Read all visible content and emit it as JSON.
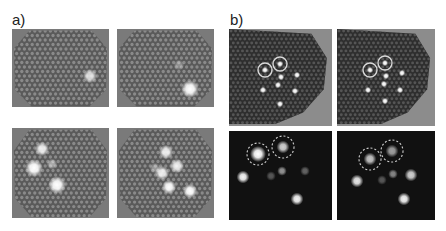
{
  "figure": {
    "labels": {
      "a": "a)",
      "b": "b)"
    },
    "group_a": {
      "description": "Brightfield images of hexagonal fiber bundle with bright spots",
      "panels": [
        {
          "id": "a-top-left",
          "spots": [
            {
              "x": 78,
              "y": 47,
              "r": 4,
              "bright": 0.8
            }
          ]
        },
        {
          "id": "a-top-right",
          "spots": [
            {
              "x": 62,
              "y": 36,
              "r": 3,
              "bright": 0.35
            },
            {
              "x": 73,
              "y": 60,
              "r": 5,
              "bright": 1.0
            }
          ]
        },
        {
          "id": "a-bottom-left",
          "spots": [
            {
              "x": 30,
              "y": 21,
              "r": 4,
              "bright": 0.9
            },
            {
              "x": 22,
              "y": 40,
              "r": 5,
              "bright": 1.0
            },
            {
              "x": 40,
              "y": 36,
              "r": 3,
              "bright": 0.5
            },
            {
              "x": 45,
              "y": 57,
              "r": 5,
              "bright": 1.0
            }
          ]
        },
        {
          "id": "a-bottom-right",
          "spots": [
            {
              "x": 49,
              "y": 24,
              "r": 4,
              "bright": 0.9
            },
            {
              "x": 60,
              "y": 38,
              "r": 4,
              "bright": 0.9
            },
            {
              "x": 45,
              "y": 45,
              "r": 4,
              "bright": 0.9
            },
            {
              "x": 38,
              "y": 40,
              "r": 3,
              "bright": 0.4
            },
            {
              "x": 52,
              "y": 59,
              "r": 4,
              "bright": 1.0
            },
            {
              "x": 73,
              "y": 63,
              "r": 4,
              "bright": 1.0
            }
          ]
        }
      ]
    },
    "group_b": {
      "description": "Fiber bundle images with circled target spots (top) and fluorescence images with dashed circles (bottom)",
      "panels": [
        {
          "id": "b-top-left",
          "circles": [
            {
              "x": 36,
              "y": 41,
              "r": 7
            },
            {
              "x": 51,
              "y": 35,
              "r": 7
            }
          ],
          "spots": [
            {
              "x": 36,
              "y": 41
            },
            {
              "x": 51,
              "y": 35
            },
            {
              "x": 52,
              "y": 48
            },
            {
              "x": 68,
              "y": 46
            },
            {
              "x": 49,
              "y": 56
            },
            {
              "x": 34,
              "y": 61
            },
            {
              "x": 66,
              "y": 62
            },
            {
              "x": 51,
              "y": 75
            }
          ]
        },
        {
          "id": "b-top-right",
          "circles": [
            {
              "x": 33,
              "y": 41,
              "r": 7
            },
            {
              "x": 48,
              "y": 34,
              "r": 7
            }
          ],
          "spots": [
            {
              "x": 33,
              "y": 41
            },
            {
              "x": 48,
              "y": 34
            },
            {
              "x": 49,
              "y": 47
            },
            {
              "x": 65,
              "y": 44
            },
            {
              "x": 47,
              "y": 55
            },
            {
              "x": 31,
              "y": 61
            },
            {
              "x": 63,
              "y": 61
            },
            {
              "x": 48,
              "y": 72
            }
          ]
        },
        {
          "id": "b-bottom-left",
          "dashed_circles": [
            {
              "x": 29,
              "y": 23,
              "r": 11
            },
            {
              "x": 54,
              "y": 16,
              "r": 11
            }
          ],
          "spots": [
            {
              "x": 29,
              "y": 23,
              "r": 5,
              "bright": 1.0
            },
            {
              "x": 54,
              "y": 16,
              "r": 4,
              "bright": 0.8
            },
            {
              "x": 14,
              "y": 46,
              "r": 4,
              "bright": 0.95
            },
            {
              "x": 42,
              "y": 45,
              "r": 3,
              "bright": 0.3
            },
            {
              "x": 53,
              "y": 40,
              "r": 3,
              "bright": 0.55
            },
            {
              "x": 76,
              "y": 40,
              "r": 3,
              "bright": 0.35
            },
            {
              "x": 68,
              "y": 68,
              "r": 4,
              "bright": 0.95
            }
          ]
        },
        {
          "id": "b-bottom-right",
          "dashed_circles": [
            {
              "x": 33,
              "y": 28,
              "r": 11
            },
            {
              "x": 55,
              "y": 20,
              "r": 11
            }
          ],
          "spots": [
            {
              "x": 33,
              "y": 28,
              "r": 4,
              "bright": 0.75
            },
            {
              "x": 55,
              "y": 20,
              "r": 4,
              "bright": 0.6
            },
            {
              "x": 20,
              "y": 50,
              "r": 4,
              "bright": 0.9
            },
            {
              "x": 45,
              "y": 49,
              "r": 3,
              "bright": 0.3
            },
            {
              "x": 56,
              "y": 43,
              "r": 3,
              "bright": 0.5
            },
            {
              "x": 74,
              "y": 44,
              "r": 4,
              "bright": 0.8
            },
            {
              "x": 67,
              "y": 68,
              "r": 4,
              "bright": 0.95
            }
          ]
        }
      ]
    }
  }
}
